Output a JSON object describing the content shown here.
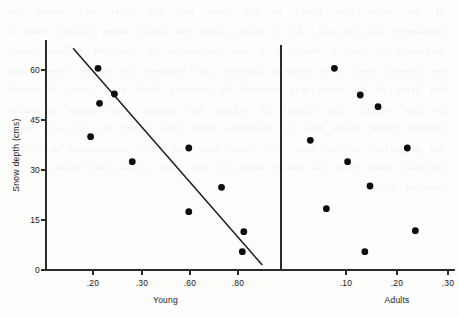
{
  "chart_data": {
    "type": "scatter",
    "title": "",
    "subtitle": "",
    "ylabel": "Snow depth  (cms)",
    "ylim": [
      0,
      68
    ],
    "yticks": [
      0,
      15,
      30,
      45,
      60
    ],
    "ytick_labels": [
      "0",
      "15",
      "30",
      "45",
      "60"
    ],
    "grid": false,
    "legend": "none",
    "panels": [
      {
        "name": "young-panel",
        "xlabel": "Young",
        "xlim": [
          0.11,
          0.9
        ],
        "xticks": [
          0.2,
          0.3,
          0.6,
          0.8
        ],
        "xtick_labels": [
          ".20",
          ".30",
          ".60",
          ".80"
        ],
        "points": [
          {
            "x": 0.285,
            "y": 60.5
          },
          {
            "x": 0.34,
            "y": 52.8
          },
          {
            "x": 0.29,
            "y": 50.0
          },
          {
            "x": 0.26,
            "y": 40.0
          },
          {
            "x": 0.59,
            "y": 36.6
          },
          {
            "x": 0.4,
            "y": 32.5
          },
          {
            "x": 0.7,
            "y": 24.8
          },
          {
            "x": 0.59,
            "y": 17.5
          },
          {
            "x": 0.775,
            "y": 11.5
          },
          {
            "x": 0.77,
            "y": 5.5
          }
        ],
        "fit_line": {
          "x0": 0.201,
          "y0": 66.5,
          "x1": 0.837,
          "y1": 1.5
        }
      },
      {
        "name": "adults-panel",
        "xlabel": "Adults",
        "xlim": [
          0.035,
          0.345
        ],
        "xticks": [
          0.1,
          0.2,
          0.3
        ],
        "xtick_labels": [
          ".10",
          ".20",
          ".30"
        ],
        "points": [
          {
            "x": 0.128,
            "y": 60.5
          },
          {
            "x": 0.173,
            "y": 52.5
          },
          {
            "x": 0.204,
            "y": 49.0
          },
          {
            "x": 0.086,
            "y": 38.9
          },
          {
            "x": 0.255,
            "y": 36.6
          },
          {
            "x": 0.151,
            "y": 32.5
          },
          {
            "x": 0.19,
            "y": 25.2
          },
          {
            "x": 0.114,
            "y": 18.4
          },
          {
            "x": 0.269,
            "y": 11.8
          },
          {
            "x": 0.181,
            "y": 5.5
          }
        ],
        "fit_line": null
      }
    ]
  },
  "geometry": {
    "width": 459,
    "height": 317,
    "y_axis_x": 46,
    "y_top": 40,
    "y_zero": 270,
    "px_per_unit_y": 3.333,
    "divider_x": 281,
    "panels": [
      {
        "x_origin": 46,
        "x_end": 281,
        "tick_px": [
          93,
          142,
          190,
          238
        ]
      },
      {
        "x_origin": 281,
        "x_end": 459,
        "tick_px": [
          346,
          397,
          448
        ]
      }
    ],
    "point_radius": 3.4,
    "tick_length": 5
  },
  "bleed_text": "of the snow was found in the open and the other end where the vegetation was thickest. At a given stand the snow depth ranged from a maximum of over a metre to a few centimetres in sheltered hollows under the denser trees. The relation between the numbers of willow grouse and the depth of the snow was assessed by counting birds at a series of stands in late winter. The counts of adults and young were made separately because young birds feed in shallower snow than adults do. At each stand the proportion of the area with snow less than thirty centimetres deep was recorded along with the mean depth of the snow across the whole of the sampled plot."
}
